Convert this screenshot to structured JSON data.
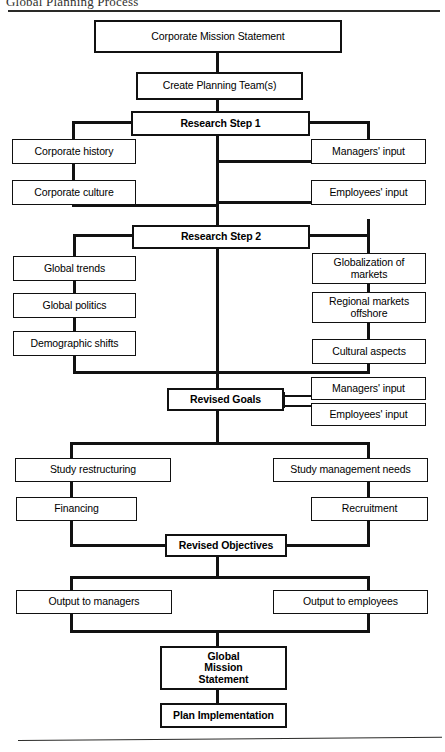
{
  "document": {
    "title": "Global Planning Process"
  },
  "flowchart": {
    "type": "flowchart",
    "orientation": "top-to-bottom",
    "nodes": [
      {
        "id": "corporate-mission-statement",
        "label": "Corporate Mission Statement",
        "level": 1
      },
      {
        "id": "create-planning-teams",
        "label": "Create Planning Team(s)",
        "level": 2
      },
      {
        "id": "research-step-1",
        "label": "Research Step 1",
        "level": 3,
        "bold": true
      },
      {
        "id": "corporate-history",
        "label": "Corporate history",
        "level": 4,
        "side": "left"
      },
      {
        "id": "corporate-culture",
        "label": "Corporate culture",
        "level": 5,
        "side": "left"
      },
      {
        "id": "managers-input-1",
        "label": "Managers' input",
        "level": 4,
        "side": "right"
      },
      {
        "id": "employees-input-1",
        "label": "Employees' input",
        "level": 5,
        "side": "right"
      },
      {
        "id": "research-step-2",
        "label": "Research Step 2",
        "level": 6,
        "bold": true
      },
      {
        "id": "global-trends",
        "label": "Global trends",
        "level": 7,
        "side": "left"
      },
      {
        "id": "global-politics",
        "label": "Global politics",
        "level": 8,
        "side": "left"
      },
      {
        "id": "demographic-shifts",
        "label": "Demographic shifts",
        "level": 9,
        "side": "left"
      },
      {
        "id": "globalization-of-markets",
        "label": "Globalization of markets",
        "level": 7,
        "side": "right"
      },
      {
        "id": "regional-markets-offshore",
        "label": "Regional markets offshore",
        "level": 8,
        "side": "right"
      },
      {
        "id": "cultural-aspects",
        "label": "Cultural aspects",
        "level": 9,
        "side": "right"
      },
      {
        "id": "revised-goals",
        "label": "Revised Goals",
        "level": 10,
        "bold": true
      },
      {
        "id": "managers-input-2",
        "label": "Managers' input",
        "level": 10,
        "side": "right"
      },
      {
        "id": "employees-input-2",
        "label": "Employees' input",
        "level": 10,
        "side": "right"
      },
      {
        "id": "study-restructuring",
        "label": "Study restructuring",
        "level": 11,
        "side": "left"
      },
      {
        "id": "financing",
        "label": "Financing",
        "level": 12,
        "side": "left"
      },
      {
        "id": "study-management-needs",
        "label": "Study management needs",
        "level": 11,
        "side": "right"
      },
      {
        "id": "recruitment",
        "label": "Recruitment",
        "level": 12,
        "side": "right"
      },
      {
        "id": "revised-objectives",
        "label": "Revised Objectives",
        "level": 13,
        "bold": true
      },
      {
        "id": "output-to-managers",
        "label": "Output to managers",
        "level": 14,
        "side": "left"
      },
      {
        "id": "output-to-employees",
        "label": "Output to employees",
        "level": 14,
        "side": "right"
      },
      {
        "id": "global-mission-statement",
        "label": "Global\nMission\nStatement",
        "level": 15,
        "bold": true
      },
      {
        "id": "plan-implementation",
        "label": "Plan Implementation",
        "level": 16,
        "bold": true
      }
    ],
    "labels": {
      "corporate_mission_statement": "Corporate Mission Statement",
      "create_planning_teams": "Create Planning Team(s)",
      "research_step_1": "Research Step 1",
      "corporate_history": "Corporate history",
      "corporate_culture": "Corporate culture",
      "managers_input_1": "Managers' input",
      "employees_input_1": "Employees' input",
      "research_step_2": "Research Step 2",
      "global_trends": "Global trends",
      "global_politics": "Global politics",
      "demographic_shifts": "Demographic shifts",
      "globalization_of_markets_l1": "Globalization of",
      "globalization_of_markets_l2": "markets",
      "regional_markets_offshore_l1": "Regional markets",
      "regional_markets_offshore_l2": "offshore",
      "cultural_aspects": "Cultural aspects",
      "revised_goals": "Revised Goals",
      "managers_input_2": "Managers' input",
      "employees_input_2": "Employees' input",
      "study_restructuring": "Study restructuring",
      "financing": "Financing",
      "study_management_needs": "Study management needs",
      "recruitment": "Recruitment",
      "revised_objectives": "Revised Objectives",
      "output_to_managers": "Output to managers",
      "output_to_employees": "Output to employees",
      "global_mission_l1": "Global",
      "global_mission_l2": "Mission",
      "global_mission_l3": "Statement",
      "plan_implementation": "Plan Implementation"
    }
  },
  "colors": {
    "line": "#111111",
    "background": "#ffffff",
    "text": "#000000",
    "rule": "#2a2a28"
  }
}
